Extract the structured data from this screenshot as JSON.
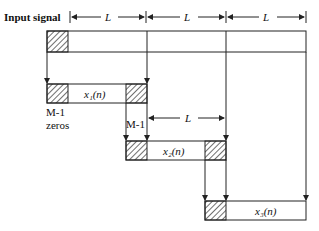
{
  "diagram": {
    "input_label": "Input signal",
    "segment_label": "L",
    "top_dimension_labels": [
      "L",
      "L",
      "L"
    ],
    "mid_dimension_label": "L",
    "overlap_label": "M-1",
    "zeros_label_line1": "M-1",
    "zeros_label_line2": "zeros",
    "blocks": [
      {
        "name": "x1",
        "label": "x₁(n)"
      },
      {
        "name": "x2",
        "label": "x₂(n)"
      },
      {
        "name": "x3",
        "label": "x₃(n)"
      }
    ],
    "colors": {
      "stroke": "#222222",
      "background": "#ffffff"
    }
  }
}
